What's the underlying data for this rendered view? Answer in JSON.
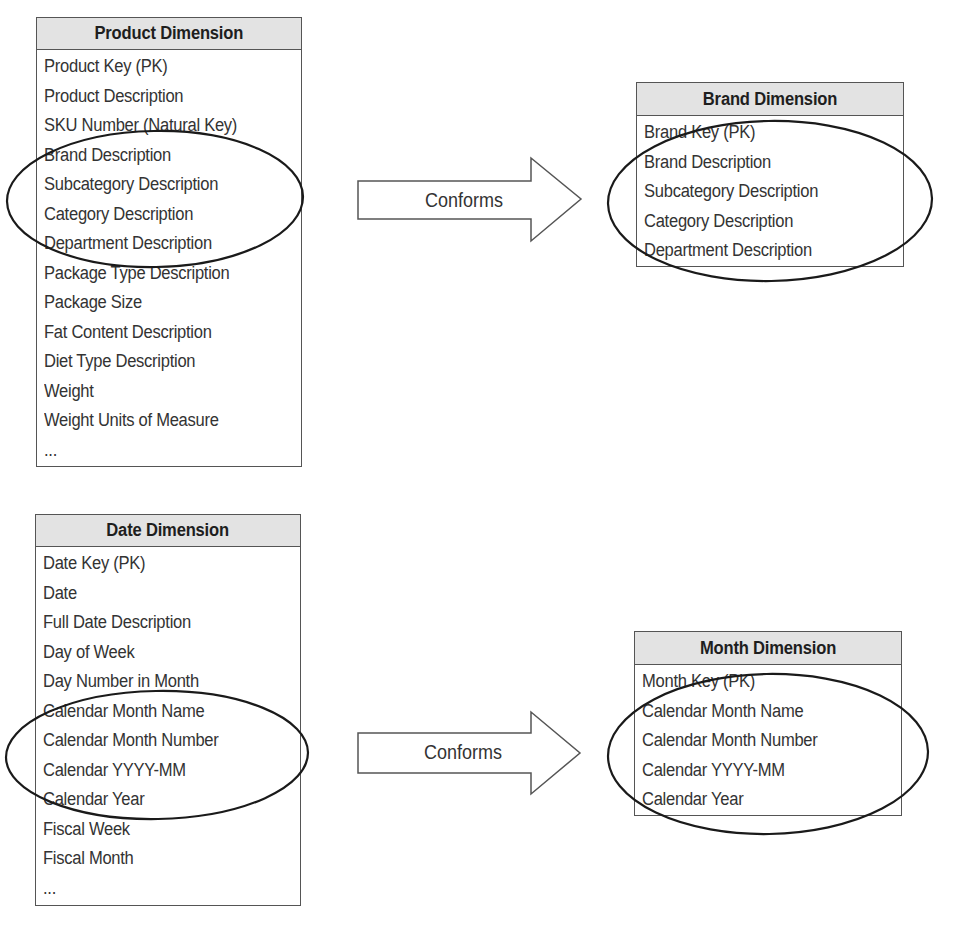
{
  "diagrams": [
    {
      "source": {
        "title": "Product Dimension",
        "attributes": [
          "Product Key (PK)",
          "Product Description",
          "SKU Number (Natural Key)",
          "Brand Description",
          "Subcategory Description",
          "Category Description",
          "Department Description",
          "Package Type Description",
          "Package Size",
          "Fat Content Description",
          "Diet Type Description",
          "Weight",
          "Weight Units of Measure",
          "..."
        ],
        "circled_attributes": [
          "Brand Description",
          "Subcategory Description",
          "Category Description",
          "Department Description"
        ]
      },
      "relationship": {
        "label": "Conforms",
        "icon": "right-arrow-icon"
      },
      "target": {
        "title": "Brand Dimension",
        "attributes": [
          "Brand Key (PK)",
          "Brand Description",
          "Subcategory Description",
          "Category Description",
          "Department Description"
        ],
        "circled_attributes": [
          "Brand Description",
          "Subcategory Description",
          "Category Description",
          "Department Description"
        ]
      }
    },
    {
      "source": {
        "title": "Date Dimension",
        "attributes": [
          "Date Key (PK)",
          "Date",
          "Full Date Description",
          "Day of Week",
          "Day Number in Month",
          "Calendar Month Name",
          "Calendar Month Number",
          "Calendar YYYY-MM",
          "Calendar Year",
          "Fiscal Week",
          "Fiscal Month",
          "..."
        ],
        "circled_attributes": [
          "Calendar Month Name",
          "Calendar Month Number",
          "Calendar YYYY-MM",
          "Calendar Year"
        ]
      },
      "relationship": {
        "label": "Conforms",
        "icon": "right-arrow-icon"
      },
      "target": {
        "title": "Month Dimension",
        "attributes": [
          "Month Key (PK)",
          "Calendar Month Name",
          "Calendar Month Number",
          "Calendar YYYY-MM",
          "Calendar Year"
        ],
        "circled_attributes": [
          "Calendar Month Name",
          "Calendar Month Number",
          "Calendar YYYY-MM",
          "Calendar Year"
        ]
      }
    }
  ],
  "colors": {
    "header_bg": "#e3e3e3",
    "border": "#555555",
    "ellipse_stroke": "#1a1a1a",
    "text": "#333333"
  }
}
